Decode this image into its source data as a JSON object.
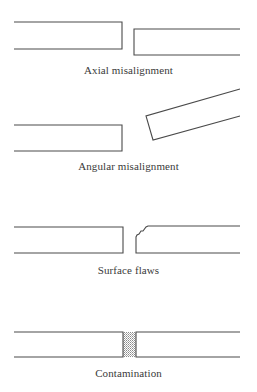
{
  "figure": {
    "panels": [
      {
        "id": "axial",
        "label": "Axial misalignment"
      },
      {
        "id": "angular",
        "label": "Angular misalignment"
      },
      {
        "id": "surface",
        "label": "Surface flaws"
      },
      {
        "id": "contamination",
        "label": "Contamination"
      }
    ],
    "colors": {
      "line": "#4a4a4a",
      "text": "#3a3a3a",
      "background": "#ffffff",
      "stipple": "#9a9a9a"
    }
  }
}
